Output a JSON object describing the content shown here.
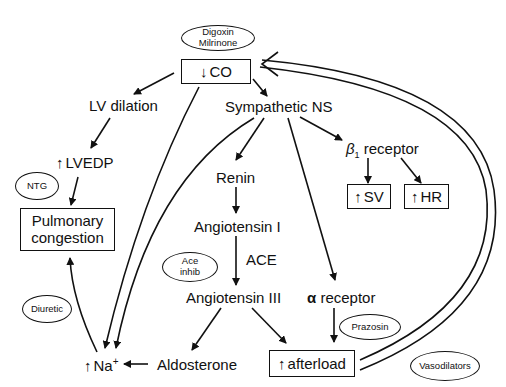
{
  "diagram": {
    "nodes": {
      "co": {
        "arrow": "↓",
        "label": "CO"
      },
      "lv_dilation": {
        "label": "LV dilation"
      },
      "sympathetic": {
        "label": "Sympathetic NS"
      },
      "lvedp": {
        "arrow": "↑",
        "label": "LVEDP"
      },
      "pulmonary": {
        "line1": "Pulmonary",
        "line2": "congestion"
      },
      "renin": {
        "label": "Renin"
      },
      "angiotensin1": {
        "label": "Angiotensin I"
      },
      "ace": {
        "label": "ACE"
      },
      "angiotensin3": {
        "label": "Angiotensin III"
      },
      "beta": {
        "symbol": "β",
        "sub": "1",
        "label": "receptor"
      },
      "sv": {
        "arrow": "↑",
        "label": "SV"
      },
      "hr": {
        "arrow": "↑",
        "label": "HR"
      },
      "alpha": {
        "symbol": "α",
        "label": "receptor"
      },
      "afterload": {
        "arrow": "↑",
        "label": "afterload"
      },
      "aldosterone": {
        "label": "Aldosterone"
      },
      "na": {
        "arrow": "↑",
        "label": "Na",
        "sup": "+"
      }
    },
    "drugs": {
      "digoxin": {
        "line1": "Digoxin",
        "line2": "Milrinone"
      },
      "ntg": {
        "label": "NTG"
      },
      "ace_inhib": {
        "line1": "Ace",
        "line2": "inhib"
      },
      "diuretic": {
        "label": "Diuretic"
      },
      "prazosin": {
        "label": "Prazosin"
      },
      "vasodilators": {
        "label": "Vasodilators"
      }
    },
    "edges": [
      [
        "co",
        "lv_dilation"
      ],
      [
        "co",
        "sympathetic"
      ],
      [
        "co",
        "na"
      ],
      [
        "lv_dilation",
        "lvedp"
      ],
      [
        "lvedp",
        "pulmonary"
      ],
      [
        "sympathetic",
        "renin"
      ],
      [
        "sympathetic",
        "beta"
      ],
      [
        "sympathetic",
        "alpha"
      ],
      [
        "sympathetic",
        "na"
      ],
      [
        "sympathetic",
        "na_2"
      ],
      [
        "renin",
        "angiotensin1"
      ],
      [
        "angiotensin1",
        "angiotensin3"
      ],
      [
        "angiotensin3",
        "aldosterone"
      ],
      [
        "angiotensin3",
        "afterload"
      ],
      [
        "beta",
        "sv"
      ],
      [
        "beta",
        "hr"
      ],
      [
        "alpha",
        "afterload"
      ],
      [
        "aldosterone",
        "na"
      ],
      [
        "na",
        "pulmonary"
      ],
      [
        "afterload",
        "co"
      ]
    ]
  }
}
